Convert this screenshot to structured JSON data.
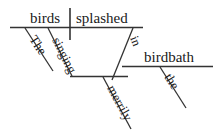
{
  "diagram": {
    "type": "reed-kellogg-sentence-diagram",
    "sentence": "The singing birds splashed merrily in the birdbath.",
    "ink_color": "#333333",
    "text_color": "#1a1a1a",
    "background_color": "#ffffff",
    "words": {
      "subject": "birds",
      "verb": "splashed",
      "subject_article": "The",
      "subject_adjective": "singing",
      "verb_adverb": "merrily",
      "preposition": "in",
      "prep_object": "birdbath",
      "prep_object_article": "the"
    },
    "lines": {
      "main_baseline": "main horizontal baseline",
      "subject_verb_divider": "vertical divider between subject and verb",
      "article_the_slant": "slanted modifier line for The",
      "adjective_singing_slant": "slanted modifier line for singing",
      "participle_singing_base": "horizontal line under singing",
      "adverb_merrily_slant": "slanted modifier line for merrily",
      "preposition_in_slant": "slanted preposition line for in",
      "prep_object_baseline": "horizontal line for birdbath",
      "article_the2_slant": "slanted modifier line for the"
    }
  }
}
